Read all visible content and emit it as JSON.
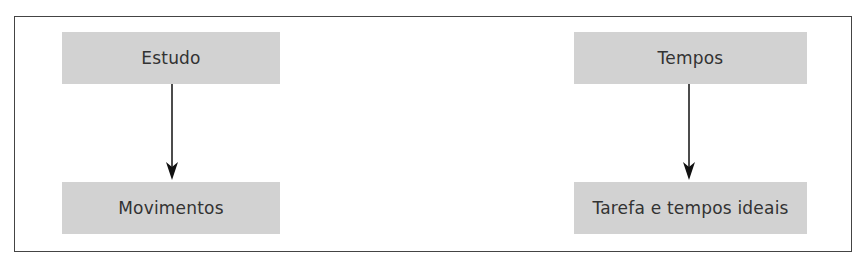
{
  "diagram": {
    "nodes": [
      {
        "id": "estudo",
        "label": "Estudo"
      },
      {
        "id": "movimentos",
        "label": "Movimentos"
      },
      {
        "id": "tempos",
        "label": "Tempos"
      },
      {
        "id": "tarefa",
        "label": "Tarefa e tempos ideais"
      }
    ],
    "edges": [
      {
        "from": "estudo",
        "to": "movimentos"
      },
      {
        "from": "tempos",
        "to": "tarefa"
      }
    ],
    "colors": {
      "box_fill": "#d2d2d2",
      "text": "#333333",
      "border": "#444444",
      "arrow": "#111111"
    }
  }
}
